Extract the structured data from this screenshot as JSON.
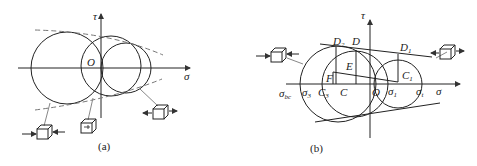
{
  "panels": [
    {
      "id": "a",
      "caption": "(a)",
      "axis_labels": {
        "vertical": "τ",
        "horizontal": "σ",
        "origin": "O"
      }
    },
    {
      "id": "b",
      "caption": "(b)",
      "axis_labels": {
        "vertical": "τ",
        "horizontal": "σ",
        "origin": "O"
      },
      "point_labels": {
        "D2": "D",
        "D2_sub": "2",
        "D": "D",
        "D1": "D",
        "D1_sub": "1",
        "E": "E",
        "F": "F",
        "C": "C",
        "C3": "C",
        "C3_sub": "3",
        "C1": "C",
        "C1_sub": "1",
        "sigma_bc": "σ",
        "sigma_bc_sub": "bc",
        "sigma3": "σ",
        "sigma3_sub": "3",
        "sigma1": "σ",
        "sigma1_sub": "1",
        "sigma_t": "σ",
        "sigma_t_sub": "t"
      }
    }
  ]
}
